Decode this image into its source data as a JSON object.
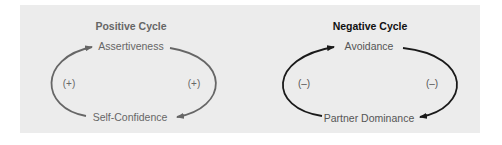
{
  "colors": {
    "panel_bg": "#ececec",
    "positive_arrow": "#666666",
    "negative_arrow": "#1a1a1a",
    "positive_text": "#666666",
    "negative_title": "#111111"
  },
  "positive_cycle": {
    "title": "Positive Cycle",
    "top_node": "Assertiveness",
    "bottom_node": "Self-Confidence",
    "left_sign": "(+)",
    "right_sign": "(+)"
  },
  "negative_cycle": {
    "title": "Negative Cycle",
    "top_node": "Avoidance",
    "bottom_node": "Partner Dominance",
    "left_sign": "(–)",
    "right_sign": "(–)"
  }
}
